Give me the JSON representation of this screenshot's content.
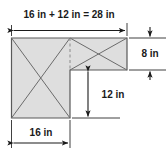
{
  "figure": {
    "colors": {
      "fill": "#dedede",
      "outline": "#595959",
      "diagonal": "#6b6b6b",
      "dimension": "#1a1a1a",
      "dashed": "#8a8a8a",
      "background": "#ffffff"
    },
    "unit": "in",
    "labels": {
      "top_width": "16 in + 12 in = 28 in",
      "right_height": "8 in",
      "inner_height": "12 in",
      "bottom_width": "16 in"
    },
    "parts": [
      {
        "name": "left-square",
        "width": "16 in",
        "height": "16 in",
        "diagonals": "X"
      },
      {
        "name": "right-rectangle",
        "width": "12 in",
        "height": "8 in",
        "diagonals": "X"
      }
    ],
    "dimensions": [
      {
        "name": "top-overall-width",
        "value": "16 in + 12 in = 28 in",
        "orientation": "horizontal"
      },
      {
        "name": "right-side-height",
        "value": "8 in",
        "orientation": "vertical"
      },
      {
        "name": "interior-vertical",
        "value": "12 in",
        "orientation": "vertical"
      },
      {
        "name": "bottom-square-width",
        "value": "16 in",
        "orientation": "horizontal"
      }
    ]
  }
}
